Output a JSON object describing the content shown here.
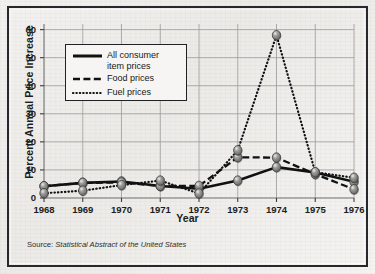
{
  "chart_data": {
    "type": "line",
    "title": "",
    "xlabel": "Year",
    "ylabel": "Percent Annual Price Increase",
    "x": [
      1968,
      1969,
      1970,
      1971,
      1972,
      1973,
      1974,
      1975,
      1976
    ],
    "xticklabels": [
      "1968",
      "1969",
      "1970",
      "1971",
      "1972",
      "1973",
      "1974",
      "1975",
      "1976"
    ],
    "yticklabels": [
      "0",
      "10",
      "20",
      "30",
      "40",
      "50",
      "60"
    ],
    "yticks": [
      0,
      10,
      20,
      30,
      40,
      50,
      60
    ],
    "ylim": [
      0,
      62
    ],
    "grid": "both",
    "legend_position": "upper-left-inside",
    "series": [
      {
        "name": "All consumer item prices",
        "style": "solid",
        "values": [
          4.2,
          5.4,
          5.9,
          4.3,
          3.3,
          6.2,
          11.0,
          9.1,
          5.8
        ]
      },
      {
        "name": "Food prices",
        "style": "dashed",
        "values": [
          4.2,
          5.4,
          5.5,
          4.3,
          4.3,
          14.5,
          14.4,
          8.5,
          3.1
        ]
      },
      {
        "name": "Fuel prices",
        "style": "dotted",
        "values": [
          1.7,
          2.6,
          4.6,
          6.2,
          1.6,
          17.0,
          58.0,
          9.2,
          7.2
        ]
      }
    ],
    "marker": "sphere-3d-gray",
    "source": {
      "prefix": "Source:",
      "publication": "Statistical Abstract of the United States"
    }
  },
  "legend": {
    "items": [
      {
        "label_line1": "All consumer",
        "label_line2": "item prices",
        "style": "solid"
      },
      {
        "label_line1": "Food prices",
        "label_line2": "",
        "style": "dashed"
      },
      {
        "label_line1": "Fuel prices",
        "label_line2": "",
        "style": "dotted"
      }
    ]
  },
  "colors": {
    "ink": "#1b1d20",
    "frame": "#26282b",
    "grid": "#9a9a98",
    "marker_fill": "#8e8f8c",
    "marker_edge": "#3a3b39",
    "paper": "#f1efed"
  }
}
